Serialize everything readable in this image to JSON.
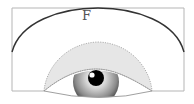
{
  "diagram": {
    "labels": {
      "arc_label": "F"
    },
    "colors": {
      "frame": "#b5b5b5",
      "arc": "#333333",
      "fold_fill": "#e6e6e6",
      "fold_stroke": "#9a9a9a",
      "lid": "#a0a0a0",
      "iris_dark": "#3a3a3a",
      "iris_light": "#d0d0d0",
      "pupil": "#000000",
      "highlight": "#ffffff"
    },
    "components": [
      "outer-frame",
      "arc-F",
      "eyelid-fold",
      "lower-eyelid",
      "iris",
      "pupil",
      "eye-highlight"
    ]
  }
}
